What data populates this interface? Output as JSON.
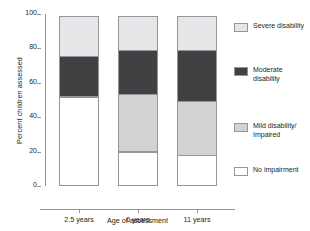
{
  "chart_data": {
    "type": "bar",
    "subtype": "stacked-bar-100",
    "title": "",
    "xlabel": "Age of assessment",
    "ylabel": "Percent children assessed",
    "categories": [
      "2.5 years",
      "6 years",
      "11 years"
    ],
    "ylim": [
      0,
      100
    ],
    "yticks": [
      0,
      20,
      40,
      60,
      80,
      100
    ],
    "ytick_labels": [
      "0",
      "20",
      "40",
      "60",
      "80",
      "100"
    ],
    "grid": false,
    "legend_position": "right",
    "series": [
      {
        "name": "Severe disability",
        "color": "#e6e7e8",
        "values": [
          24,
          20,
          20
        ]
      },
      {
        "name": "Moderate disability",
        "color": "#414042",
        "values": [
          24,
          26,
          30
        ]
      },
      {
        "name": "Mild disability/\nImpaired",
        "color": "#d1d3d4",
        "values": [
          0,
          34,
          32
        ]
      },
      {
        "name": "No impairment",
        "color": "#ffffff",
        "values": [
          52,
          20,
          18
        ]
      }
    ]
  },
  "axes": {
    "y_title": "Percent children assessed",
    "x_title": "Age of assessment",
    "y_ticks": [
      "100",
      "80",
      "60",
      "40",
      "20",
      "0"
    ],
    "x_ticks": [
      "2.5 years",
      "6 years",
      "11 years"
    ]
  },
  "legend": {
    "items": [
      {
        "label": "Severe disability",
        "color": "#e6e7e8"
      },
      {
        "label": "Moderate disability",
        "color": "#414042"
      },
      {
        "label": "Mild disability/\nImpaired",
        "color": "#d1d3d4"
      },
      {
        "label": "No impairment",
        "color": "#ffffff"
      }
    ]
  },
  "colors": {
    "axis": "#939598",
    "text": "#231f20",
    "severe": "#e6e7e8",
    "moderate": "#414042",
    "mild": "#d1d3d4",
    "none": "#ffffff"
  }
}
